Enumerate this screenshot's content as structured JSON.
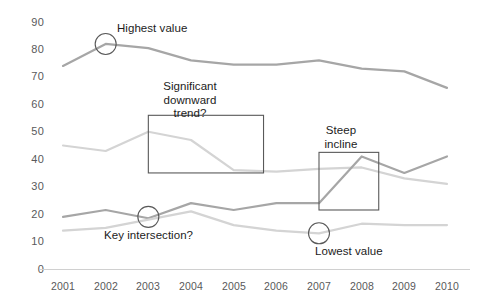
{
  "chart_data": {
    "type": "line",
    "title": "",
    "xlabel": "",
    "ylabel": "",
    "categories": [
      "2001",
      "2002",
      "2003",
      "2004",
      "2005",
      "2006",
      "2007",
      "2008",
      "2009",
      "2010"
    ],
    "x": [
      2001,
      2002,
      2003,
      2004,
      2005,
      2006,
      2007,
      2008,
      2009,
      2010
    ],
    "ylim": [
      0,
      90
    ],
    "yticks": [
      0,
      10,
      20,
      30,
      40,
      50,
      60,
      70,
      80,
      90
    ],
    "grid": false,
    "legend": "none",
    "series": [
      {
        "name": "Series A",
        "color": "#a6a6a6",
        "values": [
          74,
          82,
          80.5,
          76,
          74.5,
          74.5,
          76,
          73,
          72,
          66
        ]
      },
      {
        "name": "Series B",
        "color": "#d4d4d4",
        "values": [
          45,
          43,
          50,
          47,
          36,
          35.5,
          36.5,
          37,
          33,
          31
        ]
      },
      {
        "name": "Series C",
        "color": "#a6a6a6",
        "values": [
          19,
          21.5,
          18.5,
          24,
          21.5,
          24,
          24,
          41,
          35,
          41
        ]
      },
      {
        "name": "Series D",
        "color": "#d4d4d4",
        "values": [
          14,
          15,
          18,
          21,
          16,
          14,
          13,
          16.5,
          16,
          16
        ]
      }
    ],
    "annotations": [
      {
        "kind": "circle-callout",
        "label": "Highest value",
        "target_year": 2002,
        "target_value": 82
      },
      {
        "kind": "circle-callout",
        "label": "Key intersection?",
        "target_year": 2003,
        "target_value": 19
      },
      {
        "kind": "circle-callout",
        "label": "Lowest value",
        "target_year": 2007,
        "target_value": 13
      },
      {
        "kind": "box-callout",
        "label": "Significant\ndownward\ntrend?",
        "from_year": 2003,
        "to_year": 2005.7,
        "from_value": 35,
        "to_value": 56
      },
      {
        "kind": "box-callout",
        "label": "Steep\nincline",
        "from_year": 2007,
        "to_year": 2008.4,
        "from_value": 21.5,
        "to_value": 42.5
      }
    ],
    "axis_color": "#d0d0d0",
    "tick_label_color": "#59595b",
    "annotation_text_color": "#1c1c1c",
    "annotation_stroke_color": "#595959",
    "background": "#ffffff"
  }
}
